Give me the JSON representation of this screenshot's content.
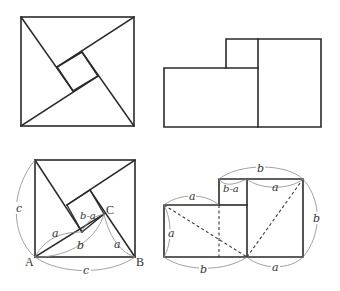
{
  "figure": {
    "panels": [
      {
        "id": "top-left",
        "title": "Square of side c dissected into four right triangles and a central square"
      },
      {
        "id": "top-right",
        "title": "Two adjoining squares of sides a and b"
      },
      {
        "id": "bottom-left",
        "title": "Labeled square dissection",
        "points": {
          "A": "A",
          "B": "B",
          "C": "C"
        },
        "labels": {
          "side_left": "c",
          "side_bottom": "c",
          "leg_a_inner": "a",
          "leg_b_inner": "b",
          "leg_a_right": "a",
          "inner_square": "b-a"
        }
      },
      {
        "id": "bottom-right",
        "title": "Labeled rearrangement into squares a² and b²",
        "labels": {
          "top_span": "b",
          "inner_square": "b-a",
          "top_right_a": "a",
          "left_top_a": "a",
          "left_side_a": "a",
          "bottom_b": "b",
          "bottom_a": "a",
          "right_side_b": "b"
        }
      }
    ]
  },
  "colors": {
    "background": "#ffffff",
    "line": "#2a2a2a",
    "dimension_arc": "#8a8a8a"
  }
}
